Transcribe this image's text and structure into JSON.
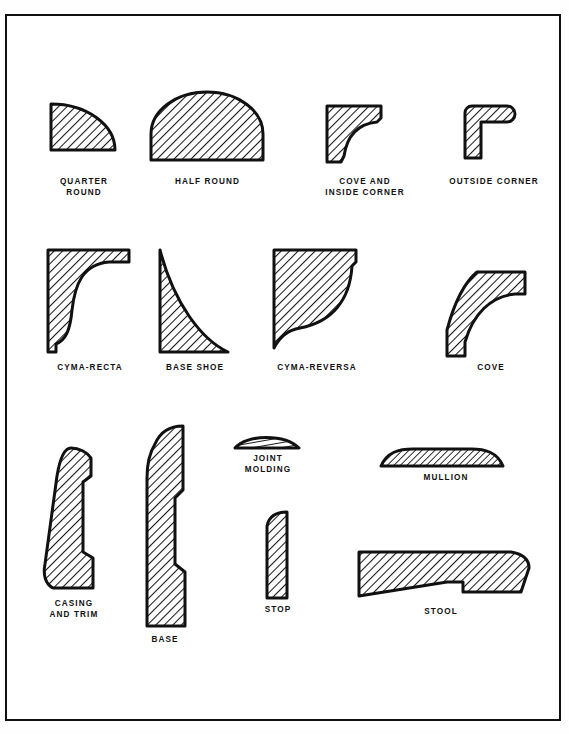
{
  "page": {
    "background_color": "#ffffff",
    "border_color": "#111111",
    "ink_color": "#111111",
    "hatch_color": "#1a1a1a"
  },
  "figures": [
    {
      "id": "quarter-round",
      "label": "QUARTER\nROUND",
      "row": 1,
      "shape": "quarter-circle",
      "x": 45,
      "y": 90,
      "width": 63,
      "height": 54,
      "caption_x": 38,
      "caption_y": 160,
      "caption_width": 78
    },
    {
      "id": "half-round",
      "label": "HALF ROUND",
      "row": 1,
      "shape": "half-circle",
      "x": 145,
      "y": 88,
      "width": 110,
      "height": 56,
      "caption_x": 148,
      "caption_y": 160,
      "caption_width": 105
    },
    {
      "id": "cove-and-inside-corner",
      "label": "COVE AND\nINSIDE CORNER",
      "row": 1,
      "shape": "cove-inside-corner",
      "x": 320,
      "y": 90,
      "width": 56,
      "height": 62,
      "caption_x": 308,
      "caption_y": 160,
      "caption_width": 100
    },
    {
      "id": "outside-corner",
      "label": "OUTSIDE CORNER",
      "row": 1,
      "shape": "outside-corner",
      "x": 452,
      "y": 90,
      "width": 56,
      "height": 62,
      "caption_x": 432,
      "caption_y": 160,
      "caption_width": 110
    },
    {
      "id": "cyma-recta",
      "label": "CYMA-RECTA",
      "row": 2,
      "shape": "cyma-recta",
      "x": 40,
      "y": 232,
      "width": 85,
      "height": 102,
      "caption_x": 36,
      "caption_y": 346,
      "caption_width": 95
    },
    {
      "id": "base-shoe",
      "label": "BASE SHOE",
      "row": 2,
      "shape": "base-shoe",
      "x": 152,
      "y": 232,
      "width": 68,
      "height": 104,
      "caption_x": 140,
      "caption_y": 346,
      "caption_width": 95
    },
    {
      "id": "cyma-reversa",
      "label": "CYMA-REVERSA",
      "row": 2,
      "shape": "cyma-reversa",
      "x": 267,
      "y": 232,
      "width": 85,
      "height": 102,
      "caption_x": 258,
      "caption_y": 346,
      "caption_width": 105
    },
    {
      "id": "cove",
      "label": "COVE",
      "row": 2,
      "shape": "cove-strip",
      "x": 437,
      "y": 250,
      "width": 95,
      "height": 88,
      "caption_x": 445,
      "caption_y": 346,
      "caption_width": 80
    },
    {
      "id": "casing-and-trim",
      "label": "CASING\nAND TRIM",
      "row": 3,
      "shape": "casing-and-trim",
      "x": 35,
      "y": 428,
      "width": 60,
      "height": 146,
      "caption_x": 25,
      "caption_y": 582,
      "caption_width": 85
    },
    {
      "id": "base",
      "label": "BASE",
      "row": 3,
      "shape": "base",
      "x": 133,
      "y": 410,
      "width": 50,
      "height": 200,
      "caption_x": 128,
      "caption_y": 618,
      "caption_width": 62
    },
    {
      "id": "joint-molding",
      "label": "JOINT\nMOLDING",
      "row": 3,
      "shape": "joint-molding",
      "x": 229,
      "y": 419,
      "width": 62,
      "height": 15,
      "caption_x": 228,
      "caption_y": 438,
      "caption_width": 66
    },
    {
      "id": "stop",
      "label": "STOP",
      "row": 3,
      "shape": "stop",
      "x": 256,
      "y": 496,
      "width": 28,
      "height": 84,
      "caption_x": 243,
      "caption_y": 588,
      "caption_width": 56
    },
    {
      "id": "mullion",
      "label": "MULLION",
      "row": 3,
      "shape": "mullion",
      "x": 375,
      "y": 433,
      "width": 122,
      "height": 18,
      "caption_x": 400,
      "caption_y": 457,
      "caption_width": 80
    },
    {
      "id": "stool",
      "label": "STOOL",
      "row": 3,
      "shape": "stool",
      "x": 352,
      "y": 531,
      "width": 172,
      "height": 52,
      "caption_x": 400,
      "caption_y": 590,
      "caption_width": 70
    }
  ]
}
